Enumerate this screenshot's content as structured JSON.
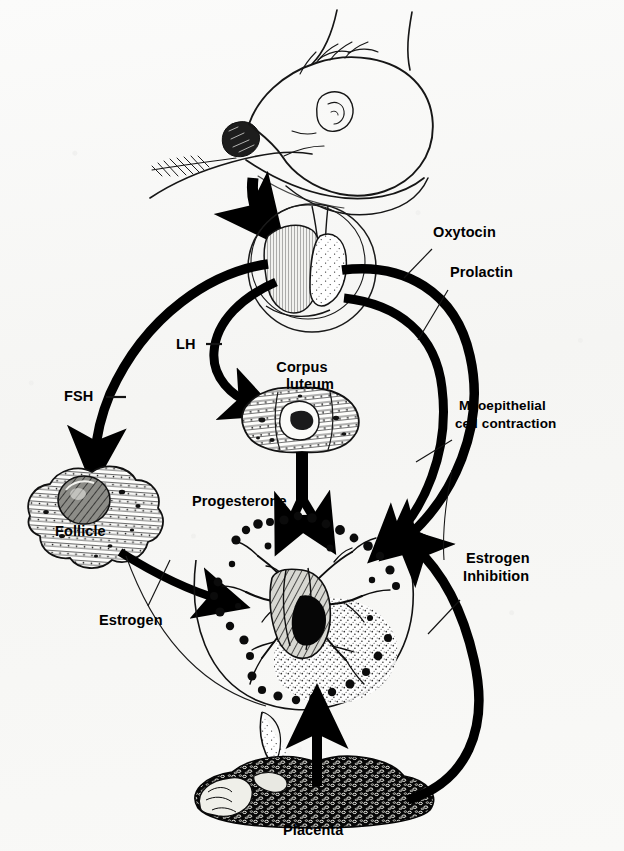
{
  "figure": {
    "domain": "biology-diagram",
    "background_color": "#f7f7f5",
    "ink_color": "#000000"
  },
  "labels": {
    "oxytocin": "Oxytocin",
    "prolactin": "Prolactin",
    "lh": "LH",
    "fsh": "FSH",
    "corpus_luteum_line1": "Corpus",
    "corpus_luteum_line2": "luteum",
    "myoepithelial_line1": "Myoepithelial",
    "myoepithelial_line2": "cell contraction",
    "progesterone": "Progesterone",
    "follicle": "Follicle",
    "estrogen": "Estrogen",
    "estrogen_inhibition_line1": "Estrogen",
    "estrogen_inhibition_line2": "Inhibition",
    "placenta": "Placenta"
  },
  "illustrations": {
    "nursing_infant": "nursing-infant-at-breast",
    "pituitary_gland": "pituitary-gland-inset",
    "corpus_luteum": "corpus-luteum-tissue",
    "ovarian_follicle": "ovarian-follicle-tissue",
    "mammary_gland": "mammary-gland-alveoli",
    "placenta": "placenta-tissue"
  },
  "arrows": [
    {
      "name": "suckling-stimulus-arrow",
      "from": "nursing-infant",
      "to": "pituitary-gland",
      "style": "solid-thick-curved"
    },
    {
      "name": "fsh-arrow",
      "from": "pituitary-gland",
      "to": "ovarian-follicle",
      "label": "FSH",
      "style": "solid-thick-curved"
    },
    {
      "name": "lh-arrow",
      "from": "pituitary-gland",
      "to": "corpus-luteum",
      "label": "LH",
      "style": "solid-thick-curved"
    },
    {
      "name": "oxytocin-arrow",
      "from": "pituitary-gland",
      "to": "mammary-gland",
      "label": "Oxytocin",
      "style": "solid-thick-curved"
    },
    {
      "name": "prolactin-arrow",
      "from": "pituitary-gland",
      "to": "mammary-gland",
      "label": "Prolactin",
      "style": "solid-thick-curved"
    },
    {
      "name": "progesterone-arrow",
      "from": "corpus-luteum",
      "to": "mammary-gland",
      "label": "Progesterone",
      "style": "solid-thick-straight"
    },
    {
      "name": "estrogen-arrow",
      "from": "ovarian-follicle",
      "to": "mammary-gland",
      "label": "Estrogen",
      "style": "solid-thick-curved"
    },
    {
      "name": "placenta-support-arrow",
      "from": "placenta",
      "to": "mammary-gland",
      "style": "solid-thick-straight"
    },
    {
      "name": "estrogen-inhibition-arrow",
      "from": "placenta",
      "to": "mammary-gland",
      "label": "Estrogen Inhibition",
      "style": "solid-thick-curved"
    }
  ]
}
